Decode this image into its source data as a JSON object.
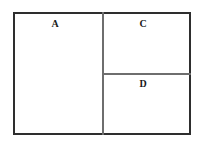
{
  "diagram": {
    "type": "rectangular-partition",
    "regions": [
      {
        "id": "A",
        "label": "A"
      },
      {
        "id": "C",
        "label": "C"
      },
      {
        "id": "D",
        "label": "D"
      }
    ]
  }
}
